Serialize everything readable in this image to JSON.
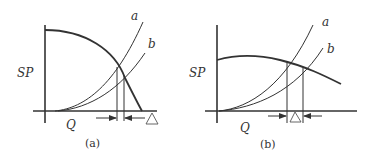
{
  "figure": {
    "panels": [
      {
        "id": "a",
        "caption": "(a)",
        "y_axis_label": "SP",
        "x_axis_label": "Q",
        "curve_labels": [
          "a",
          "b"
        ],
        "delta_label": "Δ",
        "description": "Steep fan curve with system curves a and b; small flow difference Δ"
      },
      {
        "id": "b",
        "caption": "(b)",
        "y_axis_label": "SP",
        "x_axis_label": "Q",
        "curve_labels": [
          "a",
          "b"
        ],
        "delta_label": "Δ",
        "description": "Flat fan curve with system curves a and b; larger flow difference Δ"
      }
    ],
    "colors": {
      "line": "#333333",
      "background": "#ffffff"
    }
  }
}
